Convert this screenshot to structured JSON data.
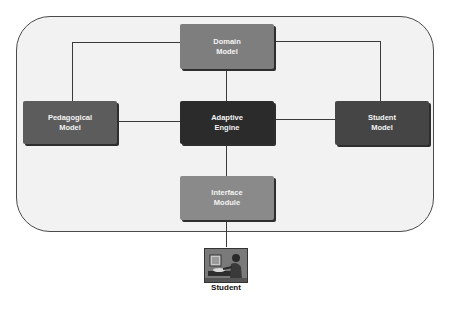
{
  "diagram": {
    "nodes": {
      "domain": {
        "line1": "Domain",
        "line2": "Model",
        "color": "#7e7e7e"
      },
      "pedagogical": {
        "line1": "Pedagogical",
        "line2": "Model",
        "color": "#5c5c5c"
      },
      "adaptive": {
        "line1": "Adaptive",
        "line2": "Engine",
        "color": "#2b2b2b"
      },
      "student_model": {
        "line1": "Student",
        "line2": "Model",
        "color": "#454545"
      },
      "interface": {
        "line1": "Interface",
        "line2": "Module",
        "color": "#8a8a8a"
      }
    },
    "actor": {
      "label": "Student",
      "icon": "student-at-computer-icon"
    },
    "edges": [
      [
        "domain",
        "pedagogical"
      ],
      [
        "domain",
        "student_model"
      ],
      [
        "domain",
        "adaptive"
      ],
      [
        "pedagogical",
        "adaptive"
      ],
      [
        "adaptive",
        "student_model"
      ],
      [
        "adaptive",
        "interface"
      ],
      [
        "interface",
        "student"
      ]
    ]
  }
}
